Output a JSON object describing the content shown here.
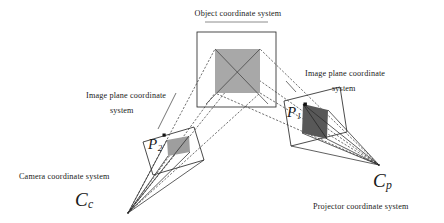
{
  "figure": {
    "title": "Object coordinate system",
    "background_color": "#ffffff",
    "line_color": "#2b2b2b",
    "object_fill_color": "#a8a8a8",
    "camera_image_fill_color": "#9e9e9e",
    "projector_image_fill_color": "#585858"
  },
  "labels": {
    "object_coordinate_system": "Object coordinate system",
    "image_plane_left_line1": "Image plane coordinate",
    "image_plane_left_line2": "system",
    "image_plane_right_line1": "Image plane coordinate",
    "image_plane_right_line2": "system",
    "camera_coordinate_system": "Camera coordinate system",
    "projector_coordinate_system": "Projector coordinate system"
  },
  "math_labels": {
    "camera_center": {
      "base": "C",
      "subscript": "c"
    },
    "projector_center": {
      "base": "C",
      "subscript": "p"
    },
    "camera_image_point": {
      "base": "P",
      "subscript": "2"
    },
    "projector_image_point": {
      "base": "P",
      "subscript": "1"
    }
  },
  "geometry": {
    "camera_center_point": {
      "x": 128,
      "y": 213
    },
    "projector_center_point": {
      "x": 379,
      "y": 165
    },
    "object_plane_rect": {
      "x": 197,
      "y": 32,
      "width": 79,
      "height": 75
    },
    "object_square": {
      "x": 215,
      "y": 49,
      "width": 45,
      "height": 44
    },
    "camera_image_plane_polygon": "143,142 194,127 204,160 153,175",
    "camera_image_patch_polygon": "167,140 189,136 190,152 168,156",
    "projector_image_plane_polygon": "284,101 340,87 347,132 291,146",
    "projector_image_patch_polygon": "303,104 328,110 327,139 302,133",
    "camera_point_dot": {
      "x": 164,
      "y": 135
    },
    "projector_point_dot": {
      "x": 305,
      "y": 104
    }
  }
}
